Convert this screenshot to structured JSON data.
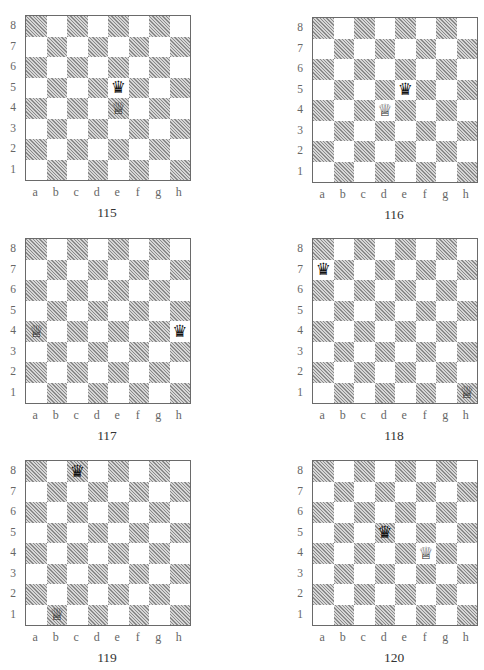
{
  "page": {
    "files": [
      "a",
      "b",
      "c",
      "d",
      "e",
      "f",
      "g",
      "h"
    ],
    "ranks": [
      "8",
      "7",
      "6",
      "5",
      "4",
      "3",
      "2",
      "1"
    ],
    "colors": {
      "dark_square": "#bdbdbd",
      "light_square": "#ffffff",
      "border": "#6a6a6a"
    },
    "piece_glyphs": {
      "white-queen": "♕",
      "black-queen": "♛"
    }
  },
  "diagrams": [
    {
      "number": "115",
      "pieces": [
        {
          "type": "black-queen",
          "square": "e5"
        },
        {
          "type": "white-queen",
          "square": "e4"
        }
      ]
    },
    {
      "number": "116",
      "pieces": [
        {
          "type": "black-queen",
          "square": "e5"
        },
        {
          "type": "white-queen",
          "square": "d4"
        }
      ]
    },
    {
      "number": "117",
      "pieces": [
        {
          "type": "white-queen",
          "square": "a4"
        },
        {
          "type": "black-queen",
          "square": "h4"
        }
      ]
    },
    {
      "number": "118",
      "pieces": [
        {
          "type": "black-queen",
          "square": "a7"
        },
        {
          "type": "white-queen",
          "square": "h1"
        }
      ]
    },
    {
      "number": "119",
      "pieces": [
        {
          "type": "black-queen",
          "square": "c8"
        },
        {
          "type": "white-queen",
          "square": "b1"
        }
      ]
    },
    {
      "number": "120",
      "pieces": [
        {
          "type": "black-queen",
          "square": "d5"
        },
        {
          "type": "white-queen",
          "square": "f4"
        }
      ]
    }
  ]
}
